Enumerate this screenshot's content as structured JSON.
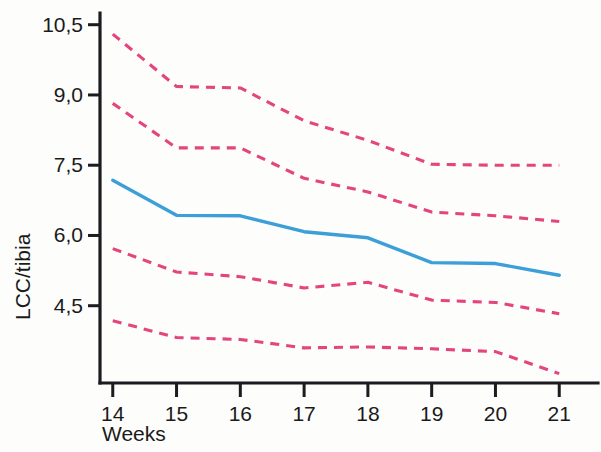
{
  "chart_data": {
    "type": "line",
    "title": "",
    "subtitle": "",
    "xlabel": "Weeks",
    "ylabel": "LCC/tibia",
    "x": [
      14,
      15,
      16,
      17,
      18,
      19,
      20,
      21
    ],
    "categories": [
      "14",
      "15",
      "16",
      "17",
      "18",
      "19",
      "20",
      "21"
    ],
    "x_tick_labels": [
      "14",
      "15",
      "16",
      "17",
      "18",
      "19",
      "20",
      "21"
    ],
    "y_tick_labels": [
      "10,5",
      "9,0",
      "7,5",
      "6,0",
      "4,5"
    ],
    "y_tick_values": [
      10.5,
      9.0,
      7.5,
      6.0,
      4.5
    ],
    "xlim": [
      13.8,
      21.2
    ],
    "ylim": [
      2.85,
      10.75
    ],
    "grid": false,
    "legend": "none",
    "decimal_separator": ",",
    "series": [
      {
        "name": "Upper 95% limit",
        "style": "dashed",
        "color": "#e4457e",
        "values": [
          10.3,
          9.18,
          9.15,
          8.45,
          8.03,
          7.52,
          7.5,
          7.5
        ]
      },
      {
        "name": "Upper 50% limit",
        "style": "dashed",
        "color": "#e4457e",
        "values": [
          8.82,
          7.87,
          7.87,
          7.22,
          6.93,
          6.5,
          6.42,
          6.3
        ]
      },
      {
        "name": "Mean LCC/tibia",
        "style": "solid",
        "color": "#3d9fd8",
        "values": [
          7.18,
          6.43,
          6.42,
          6.08,
          5.95,
          5.42,
          5.4,
          5.15
        ]
      },
      {
        "name": "Lower 50% limit",
        "style": "dashed",
        "color": "#e4457e",
        "values": [
          5.72,
          5.22,
          5.12,
          4.88,
          5.0,
          4.62,
          4.57,
          4.33
        ]
      },
      {
        "name": "Lower 95% limit",
        "style": "dashed",
        "color": "#e4457e",
        "values": [
          4.18,
          3.82,
          3.78,
          3.6,
          3.62,
          3.58,
          3.52,
          3.05
        ]
      }
    ]
  },
  "axes": {
    "y_axis_title": "LCC/tibia",
    "x_axis_title": "Weeks"
  },
  "colors": {
    "mean_line": "#3d9fd8",
    "band_line": "#e4457e",
    "axis": "#1b1b20",
    "text": "#1a1a1a",
    "background": "#fdfdfc"
  }
}
